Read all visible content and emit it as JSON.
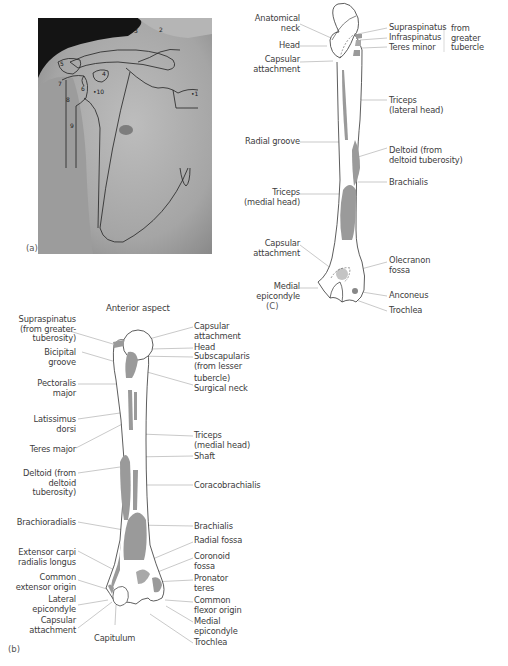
{
  "panel_a": {
    "label": "(a)",
    "markers": [
      "1",
      "2",
      "3",
      "4",
      "5",
      "6",
      "7",
      "8",
      "9",
      "10"
    ]
  },
  "panel_c": {
    "label": "(C)",
    "left_labels": [
      "Anatomical\nneck",
      "Head",
      "Capsular\nattachment",
      "Radial groove",
      "Triceps\n(medial head)",
      "Capsular\nattachment",
      "Medial\nepicondyle"
    ],
    "right_labels": [
      "Supraspinatus",
      "Infraspinatus",
      "Teres minor",
      "Triceps\n(lateral head)",
      "Deltoid (from\ndeltoid tuberosity)",
      "Brachialis",
      "Olecranon\nfossa",
      "Anconeus",
      "Trochlea"
    ],
    "group_label": "from\ngreater\ntubercle"
  },
  "panel_b": {
    "label": "(b)",
    "title": "Anterior aspect",
    "left_labels": [
      "Supraspinatus\n(from greater-\ntuberosity)",
      "Bicipital\ngroove",
      "Pectoralis\nmajor",
      "Latissimus\ndorsi",
      "Teres major",
      "Deltoid (from\ndeltoid\ntuberosity)",
      "Brachioradialis",
      "Extensor carpi\nradialis longus",
      "Common\nextensor origin",
      "Lateral\nepicondyle",
      "Capsular\nattachment"
    ],
    "bottom_label": "Capitulum",
    "right_labels": [
      "Capsular\nattachment",
      "Head",
      "Subscapularis\n(from lesser",
      "tubercle)",
      "Surgical neck",
      "Triceps\n(medial head)",
      "Shaft",
      "Coracobrachialis",
      "Brachialis",
      "Radial fossa",
      "Coronoid\nfossa",
      "Pronator\nteres",
      "Common\nflexor origin",
      "Medial\nepicondyle",
      "Trochlea"
    ]
  },
  "colors": {
    "muscle_fill": "#9a9a9a",
    "bone_outline": "#3a3a3a",
    "leader_line": "#9a9a9a",
    "photo_bg": "#111111",
    "skin": "#a9a9a9"
  }
}
